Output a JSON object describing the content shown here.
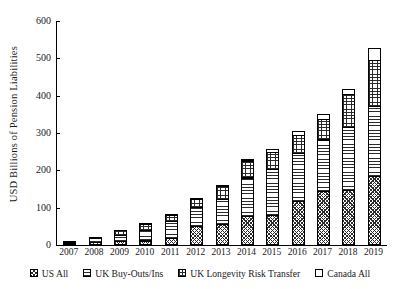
{
  "chart_data": {
    "type": "bar",
    "subtype": "stacked-bar",
    "title": "",
    "xlabel": "",
    "ylabel": "USD Billions of Pension Liabilities",
    "ylim": [
      0,
      600
    ],
    "yticks": [
      600,
      500,
      400,
      300,
      200,
      100,
      0
    ],
    "grid": false,
    "legend_position": "bottom",
    "categories": [
      "2007",
      "2008",
      "2009",
      "2010",
      "2011",
      "2012",
      "2013",
      "2014",
      "2015",
      "2016",
      "2017",
      "2018",
      "2019"
    ],
    "series": [
      {
        "name": "US All",
        "pattern": "diagonal-crosshatch",
        "values": [
          4,
          8,
          10,
          12,
          18,
          50,
          55,
          78,
          80,
          118,
          145,
          148,
          185
        ]
      },
      {
        "name": "UK Buy-Outs/Ins",
        "pattern": "horizontal-lines",
        "values": [
          6,
          14,
          20,
          30,
          48,
          55,
          70,
          105,
          125,
          130,
          140,
          170,
          190
        ]
      },
      {
        "name": "UK Longevity Risk Transfer",
        "pattern": "grid-crosshatch",
        "values": [
          2,
          5,
          14,
          18,
          18,
          24,
          38,
          48,
          50,
          52,
          58,
          90,
          125
        ]
      },
      {
        "name": "Canada All",
        "pattern": "solid-white",
        "values": [
          0,
          0,
          0,
          2,
          2,
          2,
          3,
          7,
          10,
          12,
          15,
          17,
          35
        ]
      }
    ],
    "totals": [
      12,
      27,
      44,
      62,
      86,
      131,
      166,
      238,
      265,
      312,
      358,
      425,
      535
    ]
  },
  "legend": {
    "items": [
      {
        "label": "US All"
      },
      {
        "label": "UK Buy-Outs/Ins"
      },
      {
        "label": "UK Longevity Risk Transfer"
      },
      {
        "label": "Canada All"
      }
    ]
  }
}
